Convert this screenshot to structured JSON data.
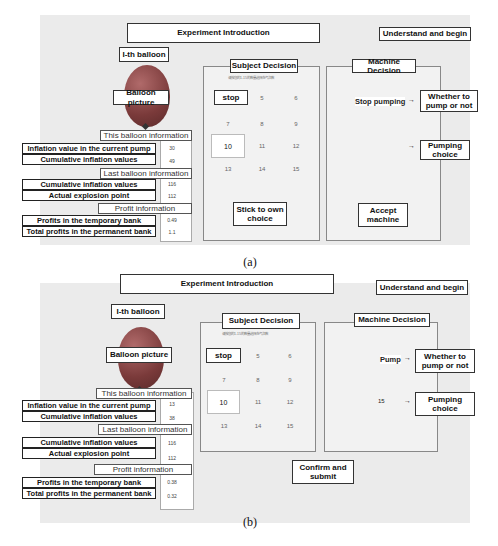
{
  "panels": [
    {
      "caption": "(a)",
      "header": "Experiment Introduction",
      "understand_button": "Understand and begin",
      "balloon_title": "I-th balloon",
      "balloon_picture": "Balloon picture",
      "this_balloon_header": "This balloon information",
      "this_balloon_rows": [
        {
          "label": "Inflation value in the current pump",
          "value": "30"
        },
        {
          "label": "Cumulative inflation values",
          "value": "49"
        }
      ],
      "last_balloon_header": "Last balloon information",
      "last_balloon_rows": [
        {
          "label": "Cumulative inflation values",
          "value": "116"
        },
        {
          "label": "Actual explosion point",
          "value": "112"
        }
      ],
      "profit_header": "Profit information",
      "profit_rows": [
        {
          "label": "Profits in the temporary bank",
          "value": "0.49"
        },
        {
          "label": "Total profits in the permanent bank",
          "value": "1.1"
        }
      ],
      "subject_decision": {
        "title": "Subject Decision",
        "hint": "请按您的1-15的数量选择充气次数",
        "stop": "stop",
        "numbers": [
          "5",
          "6",
          "7",
          "8",
          "9",
          "10",
          "11",
          "12",
          "13",
          "14",
          "15"
        ],
        "button": "Stick to own choice"
      },
      "machine_decision": {
        "title": "Machine Decision",
        "pump_output": "Stop pumping",
        "whether_box": "Whether to pump or not",
        "choice_output": "",
        "choice_box": "Pumping choice",
        "button": "Accept machine"
      }
    },
    {
      "caption": "(b)",
      "header": "Experiment Introduction",
      "understand_button": "Understand and begin",
      "balloon_title": "I-th balloon",
      "balloon_picture": "Balloon picture",
      "this_balloon_header": "This balloon information",
      "this_balloon_rows": [
        {
          "label": "Inflation value in the current pump",
          "value": "13"
        },
        {
          "label": "Cumulative inflation values",
          "value": "38"
        }
      ],
      "last_balloon_header": "Last balloon information",
      "last_balloon_rows": [
        {
          "label": "Cumulative inflation values",
          "value": "116"
        },
        {
          "label": "Actual explosion point",
          "value": "112"
        }
      ],
      "profit_header": "Profit information",
      "profit_rows": [
        {
          "label": "Profits in the temporary bank",
          "value": "0.38"
        },
        {
          "label": "Total profits in the permanent bank",
          "value": "0.32"
        }
      ],
      "subject_decision": {
        "title": "Subject Decision",
        "hint": "请按您的1-15的数量选择充气次数",
        "stop": "stop",
        "numbers": [
          "5",
          "6",
          "7",
          "8",
          "9",
          "10",
          "11",
          "12",
          "13",
          "14",
          "15"
        ],
        "button": "Confirm and submit"
      },
      "machine_decision": {
        "title": "Machine Decision",
        "pump_output": "Pump",
        "whether_box": "Whether to pump or not",
        "choice_output": "15",
        "choice_box": "Pumping choice",
        "button": ""
      }
    }
  ]
}
